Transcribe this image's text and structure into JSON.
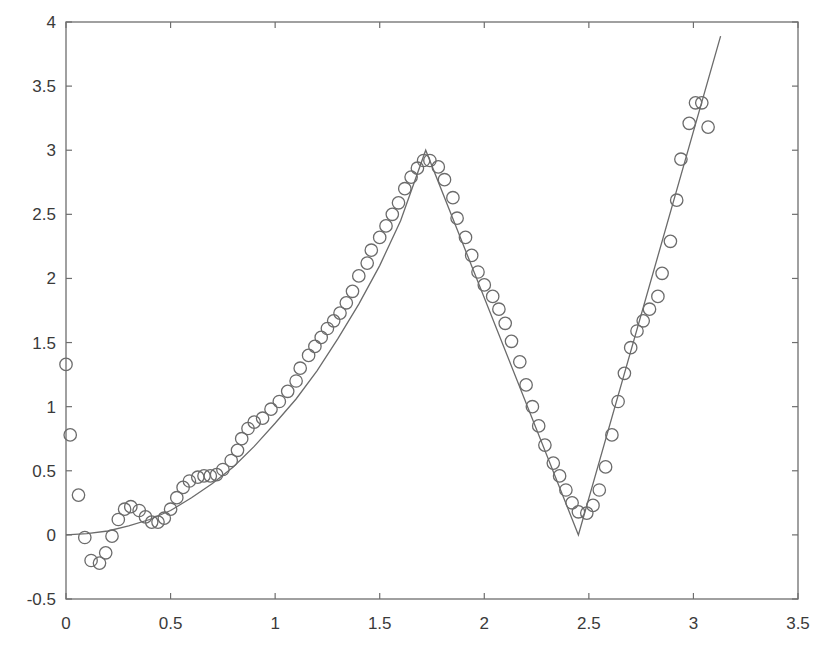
{
  "chart_data": {
    "type": "scatter",
    "title": "",
    "xlabel": "",
    "ylabel": "",
    "xlim": [
      0,
      3.5
    ],
    "ylim": [
      -0.5,
      4
    ],
    "grid": false,
    "legend": null,
    "x_ticks": [
      0,
      0.5,
      1,
      1.5,
      2,
      2.5,
      3,
      3.5
    ],
    "x_tick_labels": [
      "0",
      "0.5",
      "1",
      "1.5",
      "2",
      "2.5",
      "3",
      "3.5"
    ],
    "y_ticks": [
      -0.5,
      0,
      0.5,
      1,
      1.5,
      2,
      2.5,
      3,
      3.5,
      4
    ],
    "y_tick_labels": [
      "-0.5",
      "0",
      "0.5",
      "1",
      "1.5",
      "2",
      "2.5",
      "3",
      "3.5",
      "4"
    ],
    "series": [
      {
        "name": "data",
        "type": "scatter",
        "marker": "open-circle",
        "color": "#6b6b6b",
        "x": [
          0.0,
          0.02,
          0.06,
          0.09,
          0.12,
          0.16,
          0.19,
          0.22,
          0.25,
          0.28,
          0.31,
          0.35,
          0.38,
          0.41,
          0.44,
          0.47,
          0.5,
          0.53,
          0.56,
          0.59,
          0.63,
          0.66,
          0.69,
          0.72,
          0.75,
          0.79,
          0.82,
          0.84,
          0.87,
          0.9,
          0.94,
          0.98,
          1.02,
          1.06,
          1.1,
          1.12,
          1.16,
          1.19,
          1.22,
          1.25,
          1.28,
          1.31,
          1.34,
          1.37,
          1.4,
          1.44,
          1.46,
          1.5,
          1.53,
          1.56,
          1.59,
          1.62,
          1.65,
          1.68,
          1.71,
          1.74,
          1.78,
          1.81,
          1.85,
          1.87,
          1.91,
          1.94,
          1.97,
          2.0,
          2.04,
          2.07,
          2.1,
          2.13,
          2.17,
          2.2,
          2.23,
          2.26,
          2.29,
          2.33,
          2.36,
          2.39,
          2.42,
          2.45,
          2.49,
          2.52,
          2.55,
          2.58,
          2.61,
          2.64,
          2.67,
          2.7,
          2.73,
          2.76,
          2.79,
          2.83,
          2.85,
          2.89,
          2.92,
          2.94,
          2.98,
          3.01,
          3.04,
          3.07
        ],
        "y": [
          1.33,
          0.78,
          0.31,
          -0.02,
          -0.2,
          -0.22,
          -0.14,
          -0.01,
          0.12,
          0.2,
          0.22,
          0.19,
          0.14,
          0.1,
          0.1,
          0.13,
          0.2,
          0.29,
          0.37,
          0.42,
          0.45,
          0.46,
          0.46,
          0.47,
          0.51,
          0.58,
          0.66,
          0.75,
          0.83,
          0.88,
          0.91,
          0.98,
          1.04,
          1.12,
          1.2,
          1.3,
          1.4,
          1.47,
          1.54,
          1.61,
          1.67,
          1.73,
          1.81,
          1.9,
          2.02,
          2.12,
          2.22,
          2.32,
          2.41,
          2.5,
          2.59,
          2.7,
          2.79,
          2.86,
          2.92,
          2.92,
          2.87,
          2.77,
          2.63,
          2.47,
          2.32,
          2.18,
          2.05,
          1.95,
          1.86,
          1.76,
          1.65,
          1.51,
          1.35,
          1.17,
          1.0,
          0.85,
          0.7,
          0.56,
          0.46,
          0.35,
          0.25,
          0.18,
          0.17,
          0.23,
          0.35,
          0.53,
          0.78,
          1.04,
          1.26,
          1.46,
          1.59,
          1.67,
          1.76,
          1.86,
          2.04,
          2.29,
          2.61,
          2.93,
          3.21,
          3.37,
          3.37,
          3.18
        ]
      },
      {
        "name": "fit",
        "type": "line",
        "color": "#6b6b6b",
        "x": [
          0.0,
          0.1,
          0.2,
          0.3,
          0.4,
          0.5,
          0.6,
          0.7,
          0.8,
          0.9,
          1.0,
          1.1,
          1.2,
          1.3,
          1.4,
          1.5,
          1.6,
          1.72,
          2.45,
          3.13
        ],
        "y": [
          0.0,
          0.01,
          0.03,
          0.07,
          0.12,
          0.19,
          0.29,
          0.4,
          0.53,
          0.69,
          0.87,
          1.06,
          1.28,
          1.53,
          1.8,
          2.1,
          2.45,
          3.0,
          0.0,
          3.89
        ]
      }
    ]
  },
  "colors": {
    "axis": "#6e6e6e",
    "tick_label": "#3a3a3a",
    "background": "#ffffff"
  }
}
